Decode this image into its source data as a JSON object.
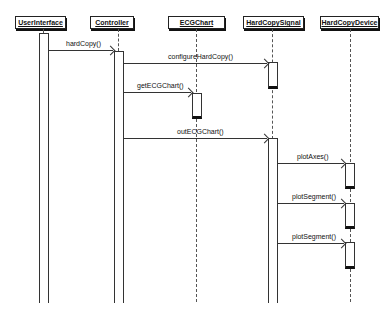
{
  "diagram": {
    "type": "UML sequence diagram",
    "participants": [
      {
        "name": "UserInterface"
      },
      {
        "name": "Controller"
      },
      {
        "name": "ECGChart"
      },
      {
        "name": "HardCopySignal"
      },
      {
        "name": "HardCopyDevice"
      }
    ],
    "messages": [
      {
        "label": "hardCopy()",
        "from": "UserInterface",
        "to": "Controller"
      },
      {
        "label": "configureHardCopy()",
        "from": "Controller",
        "to": "HardCopySignal"
      },
      {
        "label": "getECGChart()",
        "from": "Controller",
        "to": "ECGChart"
      },
      {
        "label": "outECGChart()",
        "from": "Controller",
        "to": "HardCopySignal"
      },
      {
        "label": "plotAxes()",
        "from": "HardCopySignal",
        "to": "HardCopyDevice"
      },
      {
        "label": "plotSegment()",
        "from": "HardCopySignal",
        "to": "HardCopyDevice"
      },
      {
        "label": "plotSegment()",
        "from": "HardCopySignal",
        "to": "HardCopyDevice"
      }
    ]
  }
}
